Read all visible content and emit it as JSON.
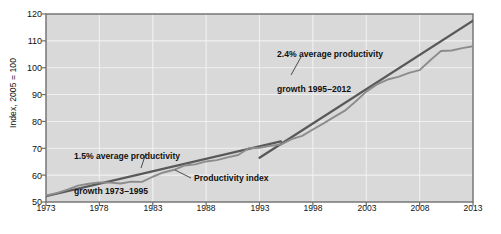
{
  "chart_data": {
    "type": "line",
    "title": "",
    "xlabel": "",
    "ylabel": "Index, 2005 = 100",
    "xlim": [
      1973,
      2013
    ],
    "ylim": [
      50,
      120
    ],
    "grid": true,
    "legend_position": "none",
    "y_ticks": [
      "120",
      "110",
      "100",
      "90",
      "80",
      "70",
      "60",
      "50"
    ],
    "y_tick_values": [
      120,
      110,
      100,
      90,
      80,
      70,
      60,
      50
    ],
    "x_ticks": [
      "1973",
      "1978",
      "1983",
      "1988",
      "1993",
      "1998",
      "2003",
      "2008",
      "2013"
    ],
    "x_tick_values": [
      1973,
      1978,
      1983,
      1988,
      1993,
      1998,
      2003,
      2008,
      2013
    ],
    "series": [
      {
        "name": "Productivity index",
        "color": "#8c8c8c",
        "x": [
          1973,
          1974,
          1975,
          1976,
          1977,
          1978,
          1979,
          1980,
          1981,
          1982,
          1983,
          1984,
          1985,
          1986,
          1987,
          1988,
          1989,
          1990,
          1991,
          1992,
          1993,
          1994,
          1995,
          1996,
          1997,
          1998,
          1999,
          2000,
          2001,
          2002,
          2003,
          2004,
          2005,
          2006,
          2007,
          2008,
          2009,
          2010,
          2011,
          2012,
          2013
        ],
        "values": [
          52.4,
          53.3,
          54.6,
          56.1,
          56.8,
          57.3,
          57.2,
          56.9,
          57.6,
          57.5,
          59.4,
          61.0,
          62.0,
          63.6,
          64.0,
          65.1,
          65.6,
          66.6,
          67.5,
          70.0,
          70.2,
          70.9,
          71.4,
          73.4,
          74.6,
          77.0,
          79.3,
          81.7,
          84.0,
          87.4,
          91.1,
          93.8,
          95.6,
          96.6,
          98.1,
          99.1,
          102.8,
          106.2,
          106.4,
          107.3,
          108.0
        ]
      },
      {
        "name": "1.5% average productivity growth trend 1973-1995",
        "color": "#595959",
        "x": [
          1973,
          1995
        ],
        "values": [
          52.2,
          72.6
        ]
      },
      {
        "name": "2.4% average productivity growth trend 1995-2012",
        "color": "#595959",
        "x": [
          1993,
          2013
        ],
        "values": [
          66.5,
          117.5
        ]
      }
    ],
    "annotations": [
      {
        "name": "growth-1973-1995",
        "line1": "1.5% average productivity",
        "line2": "growth 1973–1995"
      },
      {
        "name": "growth-1995-2012",
        "line1": "2.4% average productivity",
        "line2": "growth 1995–2012"
      },
      {
        "name": "series-label",
        "text": "Productivity index"
      }
    ],
    "colors": {
      "plot_background": "#d9d9d9",
      "gridline": "#f0f0f0",
      "axis": "#6e6e6e",
      "data_line": "#8e8e8e",
      "trend_line": "#5a5a5a",
      "text": "#111111",
      "page_background": "#ffffff"
    }
  }
}
